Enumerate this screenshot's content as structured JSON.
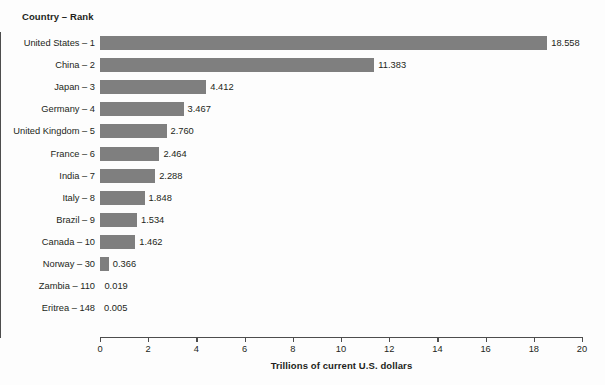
{
  "chart_data": {
    "type": "bar",
    "orientation": "horizontal",
    "title": "",
    "category_axis_title": "Country – Rank",
    "value_axis_title": "Trillions of current U.S. dollars",
    "xlabel": "Trillions of current U.S. dollars",
    "ylabel": "Country – Rank",
    "xlim": [
      0,
      20
    ],
    "xticks": [
      0,
      2,
      4,
      6,
      8,
      10,
      12,
      14,
      16,
      18,
      20
    ],
    "xtick_labels": [
      "0",
      "2",
      "4",
      "6",
      "8",
      "10",
      "12",
      "14",
      "16",
      "18",
      "20"
    ],
    "grid": false,
    "legend": false,
    "bar_color": "#7f7f7f",
    "axis_color": "#4d4d4d",
    "background_color": "#fdfdfd",
    "categories": [
      "United States – 1",
      "China – 2",
      "Japan – 3",
      "Germany – 4",
      "United Kingdom – 5",
      "France – 6",
      "India – 7",
      "Italy – 8",
      "Brazil – 9",
      "Canada  – 10",
      "Norway – 30",
      "Zambia – 110",
      "Eritrea – 148"
    ],
    "values": [
      18.558,
      11.383,
      4.412,
      3.467,
      2.76,
      2.464,
      2.288,
      1.848,
      1.534,
      1.462,
      0.366,
      0.019,
      0.005
    ],
    "value_labels": [
      "18.558",
      "11.383",
      "4.412",
      "3.467",
      "2.760",
      "2.464",
      "2.288",
      "1.848",
      "1.534",
      "1.462",
      "0.366",
      "0.019",
      "0.005"
    ]
  }
}
